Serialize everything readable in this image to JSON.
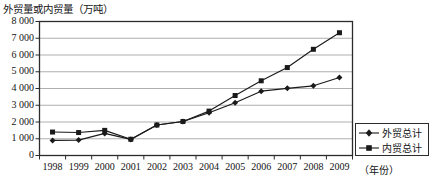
{
  "chart_data": {
    "type": "line",
    "title": "外贸量或内贸量（万吨）",
    "ylabel": "外贸量或内贸量（万吨）",
    "xlabel": "（年份）",
    "categories": [
      "1998",
      "1999",
      "2000",
      "2001",
      "2002",
      "2003",
      "2004",
      "2005",
      "2006",
      "2007",
      "2008",
      "2009"
    ],
    "ylim": [
      0,
      8000
    ],
    "ytick_labels": [
      "8 000",
      "7 000",
      "6 000",
      "5 000",
      "4 000",
      "3 000",
      "2 000",
      "1 000",
      "0"
    ],
    "ytick_values": [
      8000,
      7000,
      6000,
      5000,
      4000,
      3000,
      2000,
      1000,
      0
    ],
    "grid": true,
    "legend_position": "bottom-right",
    "series": [
      {
        "name": "外贸总计",
        "marker": "diamond",
        "color": "#1a1a1a",
        "values": [
          900,
          920,
          1320,
          960,
          1820,
          2030,
          2550,
          3150,
          3840,
          4010,
          4160,
          4660
        ]
      },
      {
        "name": "内贸总计",
        "marker": "square",
        "color": "#1a1a1a",
        "values": [
          1400,
          1370,
          1500,
          970,
          1820,
          2030,
          2650,
          3580,
          4460,
          5250,
          6340,
          7330
        ]
      }
    ]
  },
  "axis": {
    "x_title": "（年份）"
  },
  "legend": {
    "items": [
      {
        "label": "外贸总计",
        "marker": "diamond"
      },
      {
        "label": "内贸总计",
        "marker": "square"
      }
    ]
  }
}
